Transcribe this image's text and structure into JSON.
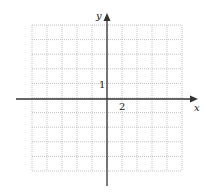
{
  "graph": {
    "type": "coordinate-grid",
    "x_axis_label": "x",
    "y_axis_label": "y",
    "x_tick_label": "2",
    "y_tick_label": "1",
    "x_scale_per_cell": 2,
    "y_scale_per_cell": 1,
    "grid_columns": 10,
    "grid_rows": 10,
    "x_range": [
      -10,
      15
    ],
    "y_range": [
      -5,
      5
    ],
    "grid": {
      "left": 32,
      "top": 25,
      "cell_w": 15,
      "cell_h": 14.6,
      "cols": 10,
      "rows": 10
    },
    "origin_px": {
      "x": 107,
      "y": 99
    },
    "colors": {
      "axis": "#333333",
      "grid": "#b5b5b5",
      "background": "#ffffff"
    }
  }
}
